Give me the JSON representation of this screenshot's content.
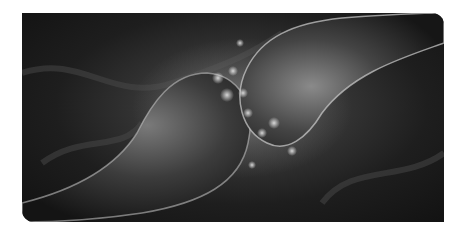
{
  "image": {
    "subject": "3D rendering of two neuron synaptic terminals with neurotransmitter particles between them",
    "palette": {
      "background": "#ffffff",
      "dark": "#111111",
      "mid": "#3a3a3a",
      "highlight": "#d8d8d8"
    }
  }
}
